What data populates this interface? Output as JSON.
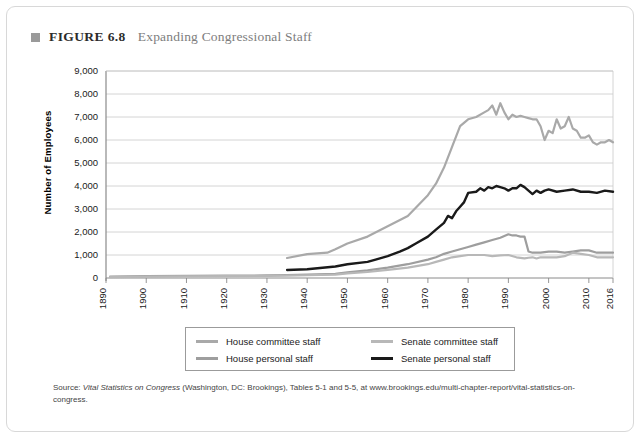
{
  "figure": {
    "marker": "square-bullet",
    "label": "FIGURE 6.8",
    "title": "Expanding Congressional Staff"
  },
  "source": {
    "prefix": "Source: ",
    "italic": "Vital Statistics on Congress",
    "rest": " (Washington, DC: Brookings), Tables 5-1 and 5-5, at www.brookings.edu/multi-chapter-report/vital-statistics-on-congress."
  },
  "legend": {
    "items": [
      {
        "label": "House committee staff",
        "color": "#a9a9a9"
      },
      {
        "label": "Senate committee staff",
        "color": "#b8b8b8"
      },
      {
        "label": "House personal staff",
        "color": "#9e9e9e"
      },
      {
        "label": "Senate personal staff",
        "color": "#1a1a1a"
      }
    ]
  },
  "chart_data": {
    "type": "line",
    "title": "Expanding Congressional Staff",
    "xlabel": "",
    "ylabel": "Number of Employees",
    "xlim": [
      1890,
      2016
    ],
    "ylim": [
      0,
      9000
    ],
    "grid": true,
    "legend_position": "bottom",
    "xticks": [
      1890,
      1900,
      1910,
      1920,
      1930,
      1940,
      1950,
      1960,
      1970,
      1980,
      1990,
      2000,
      2010,
      2016
    ],
    "xtick_labels": [
      "1890",
      "1900",
      "1910",
      "1920",
      "1930",
      "1940",
      "1950",
      "1960",
      "1970",
      "1980",
      "1990",
      "2000",
      "2010",
      "2016"
    ],
    "yticks": [
      0,
      1000,
      2000,
      3000,
      4000,
      5000,
      6000,
      7000,
      8000,
      9000
    ],
    "ytick_labels": [
      "0",
      "1,000",
      "2,000",
      "3,000",
      "4,000",
      "5,000",
      "6,000",
      "7,000",
      "8,000",
      "9,000"
    ],
    "series": [
      {
        "name": "House committee staff",
        "color": "#a9a9a9",
        "width": 2.2,
        "x": [
          1935,
          1940,
          1945,
          1947,
          1950,
          1955,
          1960,
          1965,
          1970,
          1972,
          1974,
          1976,
          1978,
          1980,
          1982,
          1984,
          1985,
          1986,
          1987,
          1988,
          1989,
          1990,
          1991,
          1992,
          1993,
          1994,
          1995,
          1996,
          1997,
          1998,
          1999,
          2000,
          2001,
          2002,
          2003,
          2004,
          2005,
          2006,
          2007,
          2008,
          2009,
          2010,
          2011,
          2012,
          2013,
          2014,
          2015,
          2016
        ],
        "y": [
          870,
          1040,
          1100,
          1250,
          1500,
          1800,
          2250,
          2700,
          3600,
          4100,
          4800,
          5700,
          6600,
          6900,
          7000,
          7200,
          7300,
          7500,
          7100,
          7600,
          7200,
          6900,
          7100,
          7000,
          7050,
          7000,
          6950,
          6900,
          6900,
          6600,
          6000,
          6400,
          6300,
          6900,
          6500,
          6600,
          7000,
          6500,
          6400,
          6100,
          6100,
          6200,
          5900,
          5800,
          5900,
          5900,
          6000,
          5900
        ]
      },
      {
        "name": "House personal staff",
        "color": "#9e9e9e",
        "width": 2.2,
        "x": [
          1891,
          1900,
          1910,
          1920,
          1930,
          1935,
          1940,
          1947,
          1950,
          1955,
          1960,
          1965,
          1970,
          1972,
          1974,
          1976,
          1978,
          1980,
          1982,
          1984,
          1986,
          1988,
          1990,
          1991,
          1992,
          1993,
          1994,
          1995,
          1996,
          1997,
          1998,
          2000,
          2002,
          2004,
          2006,
          2008,
          2010,
          2012,
          2014,
          2016
        ],
        "y": [
          60,
          80,
          90,
          100,
          110,
          130,
          150,
          180,
          250,
          330,
          450,
          600,
          800,
          900,
          1050,
          1150,
          1250,
          1350,
          1450,
          1550,
          1650,
          1750,
          1900,
          1850,
          1850,
          1800,
          1800,
          1150,
          1100,
          1100,
          1100,
          1150,
          1150,
          1100,
          1150,
          1200,
          1200,
          1100,
          1100,
          1100
        ]
      },
      {
        "name": "Senate committee staff",
        "color": "#b8b8b8",
        "width": 2.2,
        "x": [
          1891,
          1900,
          1910,
          1920,
          1930,
          1935,
          1940,
          1947,
          1950,
          1955,
          1960,
          1965,
          1970,
          1972,
          1974,
          1976,
          1978,
          1980,
          1982,
          1984,
          1986,
          1988,
          1990,
          1992,
          1994,
          1995,
          1996,
          1997,
          1998,
          2000,
          2002,
          2004,
          2006,
          2008,
          2010,
          2012,
          2014,
          2016
        ],
        "y": [
          40,
          60,
          70,
          80,
          90,
          100,
          120,
          150,
          200,
          260,
          350,
          450,
          600,
          700,
          800,
          900,
          950,
          1000,
          1000,
          1000,
          950,
          980,
          1000,
          900,
          850,
          880,
          900,
          850,
          900,
          900,
          900,
          950,
          1100,
          1050,
          1000,
          900,
          900,
          900
        ]
      },
      {
        "name": "Senate personal staff",
        "color": "#1a1a1a",
        "width": 2.4,
        "x": [
          1935,
          1940,
          1947,
          1950,
          1955,
          1957,
          1960,
          1963,
          1965,
          1967,
          1970,
          1972,
          1974,
          1975,
          1976,
          1977,
          1978,
          1979,
          1980,
          1982,
          1983,
          1984,
          1985,
          1986,
          1987,
          1988,
          1989,
          1990,
          1991,
          1992,
          1993,
          1994,
          1995,
          1996,
          1997,
          1998,
          1999,
          2000,
          2002,
          2004,
          2006,
          2008,
          2010,
          2012,
          2014,
          2016
        ],
        "y": [
          350,
          380,
          500,
          600,
          700,
          800,
          950,
          1150,
          1300,
          1500,
          1800,
          2100,
          2400,
          2700,
          2600,
          2900,
          3100,
          3300,
          3700,
          3750,
          3900,
          3800,
          3950,
          3900,
          4000,
          3950,
          3900,
          3800,
          3900,
          3900,
          4050,
          3950,
          3800,
          3650,
          3800,
          3700,
          3800,
          3850,
          3750,
          3800,
          3850,
          3750,
          3750,
          3700,
          3800,
          3750
        ]
      }
    ]
  }
}
